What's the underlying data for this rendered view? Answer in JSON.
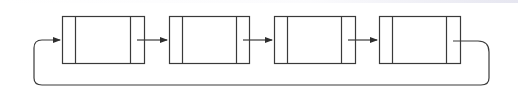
{
  "diagram": {
    "type": "circular-linked-list",
    "stroke_color": "#3a3a3a",
    "background": "#ffffff",
    "nodes": [
      {
        "id": "node-1",
        "x": 62,
        "y": 16,
        "w": 82,
        "h": 47,
        "left_div": 75,
        "right_div": 130,
        "sections": [
          "",
          "",
          ""
        ]
      },
      {
        "id": "node-2",
        "x": 169,
        "y": 16,
        "w": 80,
        "h": 47,
        "left_div": 182,
        "right_div": 236,
        "sections": [
          "",
          "",
          ""
        ]
      },
      {
        "id": "node-3",
        "x": 274,
        "y": 16,
        "w": 81,
        "h": 47,
        "left_div": 287,
        "right_div": 341,
        "sections": [
          "",
          "",
          ""
        ]
      },
      {
        "id": "node-4",
        "x": 379,
        "y": 16,
        "w": 81,
        "h": 47,
        "left_div": 392,
        "right_div": 446,
        "sections": [
          "",
          "",
          ""
        ]
      }
    ],
    "edges": [
      {
        "from": "node-1",
        "to": "node-2",
        "path": "M137 40 L167 40"
      },
      {
        "from": "node-2",
        "to": "node-3",
        "path": "M243 40 L272 40"
      },
      {
        "from": "node-3",
        "to": "node-4",
        "path": "M348 40 L377 40"
      },
      {
        "from": "node-4",
        "to": "node-1",
        "path": "M453 41 L478 41 Q489 41 489 52 L489 78 Q489 85 481 85 L42 85 Q34 85 34 78 L34 48 Q34 40 42 40 L60 40"
      }
    ]
  }
}
